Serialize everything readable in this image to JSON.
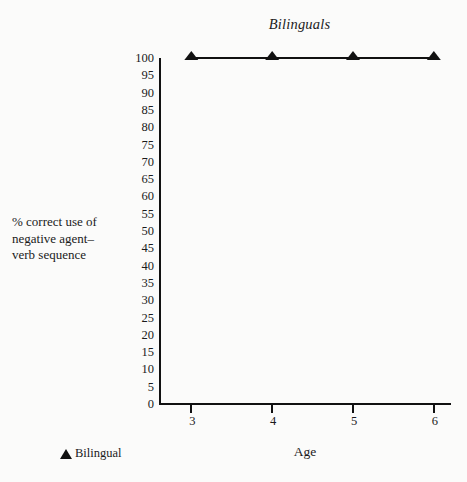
{
  "chart_data": {
    "type": "line",
    "title": "Bilinguals",
    "xlabel": "Age",
    "ylabel": "% correct use of negative agent–verb sequence",
    "ylabel_lines": [
      "% correct use of",
      "negative agent–",
      "verb sequence"
    ],
    "categories": [
      3,
      4,
      5,
      6
    ],
    "x": [
      3,
      4,
      5,
      6
    ],
    "xtick_labels": [
      "3",
      "4",
      "5",
      "6"
    ],
    "xlim": [
      2.6,
      6.2
    ],
    "ylim": [
      0,
      100
    ],
    "ytick_labels": [
      "100",
      "95",
      "90",
      "85",
      "80",
      "75",
      "70",
      "65",
      "60",
      "55",
      "50",
      "45",
      "40",
      "35",
      "30",
      "25",
      "20",
      "15",
      "10",
      "5",
      "0"
    ],
    "ytick_values": [
      100,
      95,
      90,
      85,
      80,
      75,
      70,
      65,
      60,
      55,
      50,
      45,
      40,
      35,
      30,
      25,
      20,
      15,
      10,
      5,
      0
    ],
    "grid": false,
    "legend_position": "below-left",
    "series": [
      {
        "name": "Bilingual",
        "values": [
          100,
          100,
          100,
          100
        ],
        "marker": "triangle-up",
        "color": "#111111"
      }
    ],
    "legend": [
      {
        "label": "Bilingual",
        "marker": "triangle-up-icon",
        "color": "#111111"
      }
    ]
  },
  "colors": {
    "background": "#fbfbfa",
    "ink": "#1a1a1a",
    "axis": "#111111",
    "series": "#111111"
  }
}
